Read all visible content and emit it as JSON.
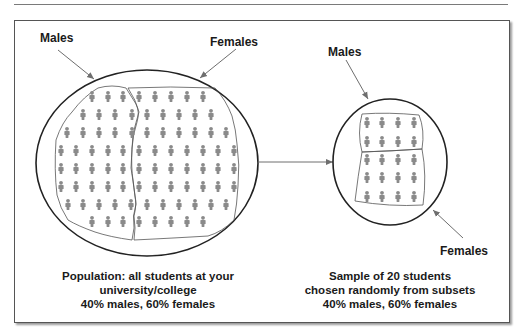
{
  "figure": {
    "population": {
      "label_males": "Males",
      "label_females": "Females",
      "caption": {
        "line1": "Population: all students at your",
        "line2": "university/college",
        "line3": "40% males, 60% females"
      },
      "rows": [
        {
          "y": 97,
          "male_x": [
            92,
            108,
            123
          ],
          "female_x": [
            139,
            155,
            171,
            187,
            203
          ]
        },
        {
          "y": 115,
          "male_x": [
            83,
            99,
            115,
            132
          ],
          "female_x": [
            147,
            163,
            179,
            195,
            211
          ]
        },
        {
          "y": 133,
          "male_x": [
            67,
            83,
            99,
            115,
            132
          ],
          "female_x": [
            147,
            163,
            179,
            195,
            211,
            226
          ]
        },
        {
          "y": 151,
          "male_x": [
            61,
            76,
            92,
            108,
            123
          ],
          "female_x": [
            139,
            155,
            171,
            187,
            203,
            218,
            234
          ]
        },
        {
          "y": 169,
          "male_x": [
            61,
            76,
            92,
            108,
            123
          ],
          "female_x": [
            139,
            155,
            171,
            187,
            203,
            218,
            234
          ]
        },
        {
          "y": 187,
          "male_x": [
            61,
            76,
            92,
            108,
            123
          ],
          "female_x": [
            139,
            155,
            171,
            187,
            203,
            218,
            234
          ]
        },
        {
          "y": 205,
          "male_x": [
            68,
            83,
            99,
            115,
            131
          ],
          "female_x": [
            147,
            163,
            179,
            195,
            211,
            226
          ]
        },
        {
          "y": 222,
          "male_x": [
            92,
            108,
            123
          ],
          "female_x": [
            139,
            155,
            171,
            187,
            203
          ]
        }
      ]
    },
    "sample": {
      "label_males": "Males",
      "label_females": "Females",
      "caption": {
        "line1": "Sample of 20 students",
        "line2": "chosen randomly from subsets",
        "line3": "40% males, 60% females"
      },
      "male_rows": [
        123,
        142
      ],
      "female_rows": [
        160,
        178,
        197
      ],
      "cols": [
        367,
        382,
        398,
        414
      ]
    }
  },
  "colors": {
    "person": "#8a8a8a",
    "outline": "#222222",
    "arrow": "#6e6e6e"
  }
}
